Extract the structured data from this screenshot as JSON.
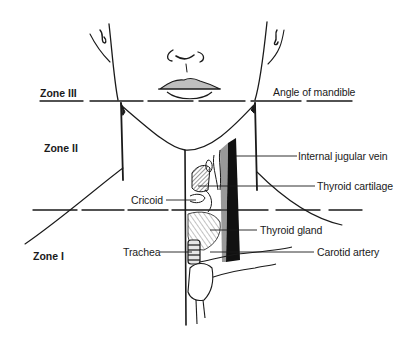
{
  "diagram": {
    "zones": [
      {
        "id": "zone3",
        "label": "Zone III"
      },
      {
        "id": "zone2",
        "label": "Zone II"
      },
      {
        "id": "zone1",
        "label": "Zone I"
      }
    ],
    "labels": {
      "angle_of_mandible": "Angle of mandible",
      "internal_jugular_vein": "Internal jugular vein",
      "thyroid_cartilage": "Thyroid cartilage",
      "cricoid": "Cricoid",
      "thyroid_gland": "Thyroid gland",
      "trachea": "Trachea",
      "carotid_artery": "Carotid artery"
    },
    "colors": {
      "ink": "#1a1a1a",
      "background": "#ffffff"
    }
  }
}
